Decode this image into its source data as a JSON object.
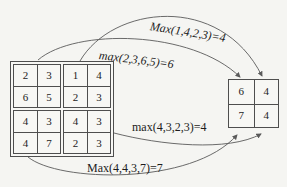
{
  "diagram": {
    "type": "max-pooling-illustration",
    "colors": {
      "background": "#f5f5f2",
      "line": "#5a5a5a",
      "text": "#1c1c1c",
      "border": "#4e4e4e"
    }
  },
  "input_matrix": {
    "rows": [
      [
        2,
        3,
        1,
        4
      ],
      [
        6,
        5,
        2,
        3
      ],
      [
        4,
        3,
        4,
        3
      ],
      [
        4,
        7,
        2,
        3
      ]
    ]
  },
  "output_matrix": {
    "rows": [
      [
        6,
        4
      ],
      [
        7,
        4
      ]
    ]
  },
  "annotations": {
    "top": "Max(1,4,2,3)=4",
    "upper": "max(2,3,6,5)=6",
    "lower": "max(4,3,2,3)=4",
    "bottom": "Max(4,4,3,7)=7"
  }
}
